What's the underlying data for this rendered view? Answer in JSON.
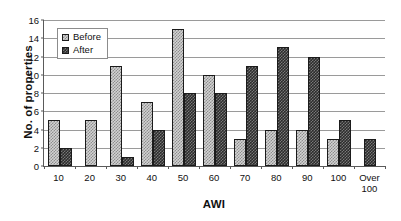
{
  "chart_data": {
    "type": "bar",
    "title": "",
    "xlabel": "AWI",
    "ylabel": "No. of properties",
    "categories": [
      "10",
      "20",
      "30",
      "40",
      "50",
      "60",
      "70",
      "80",
      "90",
      "100",
      "Over\n100"
    ],
    "series": [
      {
        "name": "Before",
        "values": [
          5,
          5,
          11,
          7,
          15,
          10,
          3,
          4,
          4,
          3,
          0
        ],
        "color": "#d2d2d2",
        "pattern": "light-checker"
      },
      {
        "name": "After",
        "values": [
          2,
          0,
          1,
          4,
          8,
          8,
          11,
          13,
          12,
          5,
          3
        ],
        "color": "#2c2c2c",
        "pattern": "dark-checker"
      }
    ],
    "ylim": [
      0,
      16
    ],
    "ytick_step": 2,
    "yticks": [
      "0",
      "2",
      "4",
      "6",
      "8",
      "10",
      "12",
      "14",
      "16"
    ],
    "grid": true,
    "grid_axis": "y",
    "legend_position": "upper-left-inside",
    "background_color": "#ffffff",
    "axis_color": "#5a5a5a",
    "grid_color": "#9a9a9a"
  }
}
